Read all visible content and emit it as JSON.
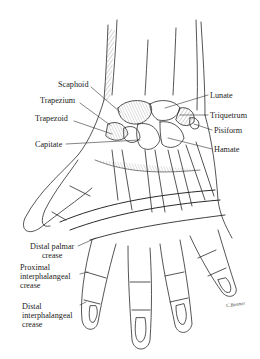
{
  "figure": {
    "labels_left": [
      {
        "id": "scaphoid",
        "text": "Scaphoid"
      },
      {
        "id": "trapezium",
        "text": "Trapezium"
      },
      {
        "id": "trapezoid",
        "text": "Trapezoid"
      },
      {
        "id": "capitate",
        "text": "Capitate"
      }
    ],
    "labels_right": [
      {
        "id": "lunate",
        "text": "Lunate"
      },
      {
        "id": "triquetrum",
        "text": "Triquetrum"
      },
      {
        "id": "pisiform",
        "text": "Pisiform"
      },
      {
        "id": "hamate",
        "text": "Hamate"
      }
    ],
    "crease_labels": [
      {
        "id": "distal-palmar",
        "lines": [
          "Distal palmar",
          "crease"
        ]
      },
      {
        "id": "proximal-ip",
        "lines": [
          "Proximal",
          "interphalangeal",
          "crease"
        ]
      },
      {
        "id": "distal-ip",
        "lines": [
          "Distal",
          "interphalangeal",
          "crease"
        ]
      }
    ],
    "signature": "C.Bonner",
    "colors": {
      "ink": "#2a2a2a",
      "background": "#ffffff"
    }
  }
}
